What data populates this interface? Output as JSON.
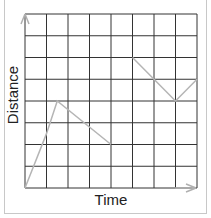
{
  "chart_data": {
    "type": "line",
    "title": "",
    "xlabel": "Time",
    "ylabel": "Distance",
    "xlim": [
      0,
      8
    ],
    "ylim": [
      0,
      8
    ],
    "grid": true,
    "grid_divisions": {
      "x": 8,
      "y": 8
    },
    "tick_labels": {
      "x": [],
      "y": []
    },
    "legend": null,
    "series": [
      {
        "name": "distance-time",
        "color": "#b5b5b5",
        "points": [
          [
            0,
            0
          ],
          [
            1,
            2.5
          ],
          [
            1.5,
            4
          ],
          [
            4,
            2
          ]
        ]
      },
      {
        "name": "distance-time-2",
        "color": "#b5b5b5",
        "points": [
          [
            5,
            6
          ],
          [
            7,
            4
          ],
          [
            8,
            5
          ]
        ]
      }
    ]
  },
  "colors": {
    "grid": "#333333",
    "line": "#b5b5b5",
    "axis_arrow": "#b0b0b0",
    "frame": "#c8c8c8"
  }
}
